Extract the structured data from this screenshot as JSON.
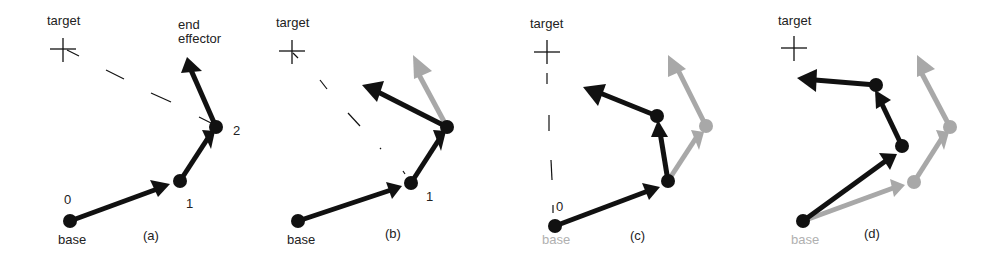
{
  "figure": {
    "colors": {
      "current": "#111111",
      "previous": "#a8a8a8",
      "text": "#222222",
      "faded_text": "#b0b0b0"
    },
    "panels": [
      {
        "id": "a",
        "caption": "(a)",
        "target_label": "target",
        "end_effector_label": "end\neffector",
        "joint_labels": [
          "0",
          "1",
          "2"
        ],
        "base_label": "base"
      },
      {
        "id": "b",
        "caption": "(b)",
        "target_label": "target",
        "joint_labels": [
          "1"
        ],
        "base_label": "base"
      },
      {
        "id": "c",
        "caption": "(c)",
        "target_label": "target",
        "joint_labels": [
          "0"
        ],
        "base_label": "base"
      },
      {
        "id": "d",
        "caption": "(d)",
        "target_label": "target",
        "base_label": "base"
      }
    ]
  }
}
